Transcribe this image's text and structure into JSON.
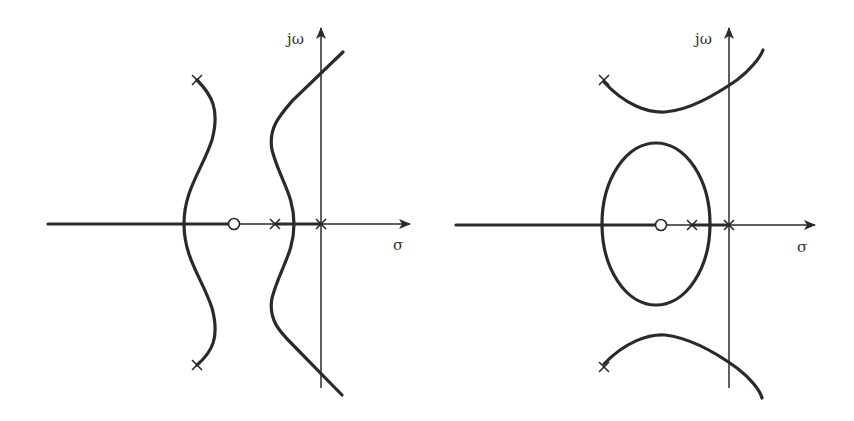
{
  "figure": {
    "left": {
      "y_axis_label": "jω",
      "x_axis_label": "σ",
      "poles": [
        "complex pair (upper-left/lower-left)",
        "real pole",
        "pole at origin"
      ],
      "zeros": [
        "real zero"
      ]
    },
    "right": {
      "y_axis_label": "jω",
      "x_axis_label": "σ",
      "poles": [
        "complex pair (upper-left/lower-left)",
        "real pole",
        "pole at origin"
      ],
      "zeros": [
        "real zero"
      ]
    }
  },
  "colors": {
    "ink": "#2a2a2a",
    "background": "#ffffff"
  }
}
